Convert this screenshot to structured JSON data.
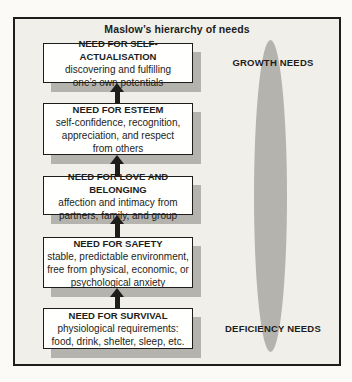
{
  "title": "Maslow’s hierarchy of needs",
  "levels": [
    {
      "heading": "NEED FOR SELF-ACTUALISATION",
      "lines": [
        "discovering and fulfilling",
        "one’s own potentials"
      ]
    },
    {
      "heading": "NEED FOR ESTEEM",
      "lines": [
        "self-confidence, recognition,",
        "appreciation, and respect",
        "from others"
      ]
    },
    {
      "heading": "NEED FOR LOVE AND BELONGING",
      "lines": [
        "affection and intimacy from",
        "partners, family, and group"
      ]
    },
    {
      "heading": "NEED FOR SAFETY",
      "lines": [
        "stable, predictable environment,",
        "free from physical, economic, or",
        "psychological anxiety"
      ]
    },
    {
      "heading": "NEED FOR SURVIVAL",
      "lines": [
        "physiological requirements:",
        "food, drink, shelter, sleep, etc."
      ]
    }
  ],
  "annotations": {
    "growth": "GROWTH NEEDS",
    "deficiency": "DEFICIENCY NEEDS"
  },
  "colors": {
    "frame_background": "#f1efe9",
    "frame_border": "#1d1d1b",
    "box_background": "#fffffd",
    "shadow_and_oval_gray": "#b5b3ae",
    "text": "#1d1d1b"
  }
}
